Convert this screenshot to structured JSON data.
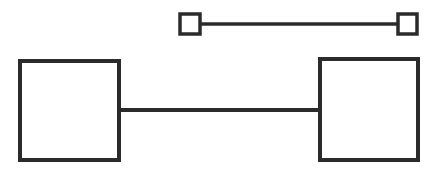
{
  "diagram": {
    "stroke_color": "#2b2b2b",
    "background": "#ffffff",
    "small_connector": {
      "left_square": {
        "x": 180,
        "y": 14,
        "size": 20
      },
      "right_square": {
        "x": 398,
        "y": 14,
        "size": 20
      },
      "line": {
        "x1": 200,
        "y1": 24,
        "x2": 398,
        "y2": 24
      }
    },
    "large_connector": {
      "left_box": {
        "x": 20,
        "y": 61,
        "width": 99,
        "height": 99
      },
      "right_box": {
        "x": 320,
        "y": 59,
        "width": 98,
        "height": 101
      },
      "line": {
        "x1": 119,
        "y1": 110,
        "x2": 320,
        "y2": 110
      }
    }
  }
}
